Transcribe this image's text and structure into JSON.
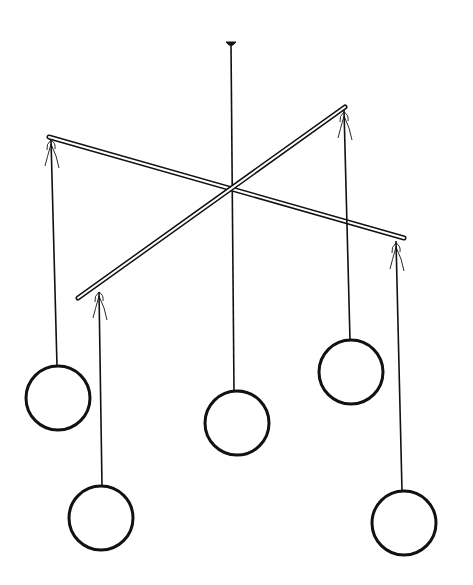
{
  "illustration": {
    "subject": "hanging mobile with two crossed rods and five circles",
    "background": "#ffffff",
    "stroke": "#111111",
    "mount": {
      "x": 231,
      "y": 44
    },
    "center_cord": {
      "x1": 231,
      "y1": 44,
      "x2": 234,
      "y2": 391
    },
    "rods": [
      {
        "x1": 49,
        "y1": 137,
        "x2": 404,
        "y2": 238
      },
      {
        "x1": 78,
        "y1": 298,
        "x2": 345,
        "y2": 107
      }
    ],
    "strings": [
      {
        "x1": 51,
        "y1": 140,
        "x2": 57,
        "y2": 366
      },
      {
        "x1": 99,
        "y1": 292,
        "x2": 102,
        "y2": 486
      },
      {
        "x1": 344,
        "y1": 110,
        "x2": 350,
        "y2": 340
      },
      {
        "x1": 396,
        "y1": 241,
        "x2": 402,
        "y2": 491
      }
    ],
    "circles": [
      {
        "cx": 58,
        "cy": 398,
        "r": 32
      },
      {
        "cx": 101,
        "cy": 518,
        "r": 32
      },
      {
        "cx": 237,
        "cy": 423,
        "r": 32
      },
      {
        "cx": 351,
        "cy": 372,
        "r": 32
      },
      {
        "cx": 404,
        "cy": 523,
        "r": 32
      }
    ],
    "bows": [
      {
        "x": 51,
        "y": 140
      },
      {
        "x": 99,
        "y": 292
      },
      {
        "x": 344,
        "y": 112
      },
      {
        "x": 396,
        "y": 243
      }
    ]
  }
}
